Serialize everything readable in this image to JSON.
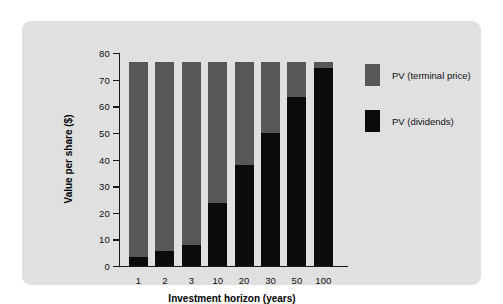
{
  "chart_data": {
    "type": "bar",
    "subtype": "stacked-bar",
    "title": "",
    "xlabel": "Investment horizon (years)",
    "ylabel": "Value per share ($)",
    "categories": [
      "1",
      "2",
      "3",
      "10",
      "20",
      "30",
      "50",
      "100"
    ],
    "series": [
      {
        "name": "PV (dividends)",
        "color": "#0b0b0c",
        "values": [
          3.3,
          5.5,
          7.8,
          23.7,
          38.0,
          50.0,
          63.3,
          74.5
        ]
      },
      {
        "name": "PV (terminal price)",
        "color": "#555759",
        "values": [
          73.2,
          71.0,
          68.7,
          52.8,
          38.5,
          26.5,
          13.2,
          2.0
        ]
      }
    ],
    "stack_totals": [
      76.5,
      76.5,
      76.5,
      76.5,
      76.5,
      76.5,
      76.5,
      76.5
    ],
    "ylim": [
      0,
      80
    ],
    "yticks": [
      0,
      10,
      20,
      30,
      40,
      50,
      60,
      70,
      80
    ],
    "ytick_labels": [
      "0",
      "10",
      "20",
      "30",
      "40",
      "50",
      "60",
      "70",
      "80"
    ],
    "grid": false,
    "legend_position": "right",
    "legend_order": [
      "PV (terminal price)",
      "PV (dividends)"
    ],
    "background_color": "#e0e0e0",
    "axis_color": "#1a1a1a"
  }
}
